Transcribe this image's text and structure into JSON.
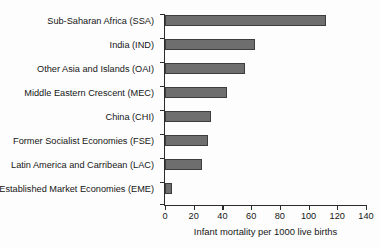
{
  "chart_data": {
    "type": "bar",
    "orientation": "horizontal",
    "title": "",
    "xlabel": "Infant mortality per 1000 live births",
    "ylabel": "",
    "categories": [
      "Sub-Saharan Africa (SSA)",
      "India (IND)",
      "Other Asia and Islands (OAI)",
      "Middle Eastern Crescent (MEC)",
      "China (CHI)",
      "Former Socialist Economies (FSE)",
      "Latin America and Carribean (LAC)",
      "Established Market Economies (EME)"
    ],
    "values": [
      112,
      63,
      56,
      43,
      32,
      30,
      26,
      5
    ],
    "xlim": [
      0,
      140
    ],
    "xticks": [
      0,
      20,
      40,
      60,
      80,
      100,
      120,
      140
    ],
    "xtick_labels": [
      "0",
      "20",
      "40",
      "60",
      "80",
      "100",
      "120",
      "140"
    ],
    "grid": false,
    "legend": null,
    "bar_color": "#6e6e6e",
    "bar_edge_color": "#3d3d3d",
    "axis_color": "#2b2b2b",
    "background_color": "#fdfdfd"
  }
}
